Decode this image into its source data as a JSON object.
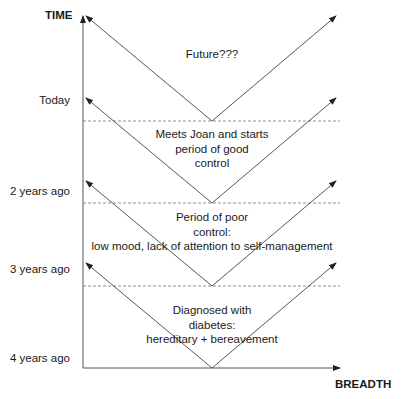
{
  "axes": {
    "y_title": "TIME",
    "x_title": "BREADTH",
    "y_ticks": [
      "Today",
      "2 years ago",
      "3 years ago",
      "4 years ago"
    ]
  },
  "periods": [
    {
      "label": "Future???"
    },
    {
      "label_lines": [
        "Meets Joan and starts",
        "period of good",
        "control"
      ]
    },
    {
      "label_lines": [
        "Period of poor",
        "control:",
        "low mood, lack of attention to self-management"
      ]
    },
    {
      "label_lines": [
        "Diagnosed with",
        "diabetes:",
        "hereditary + bereavement"
      ]
    }
  ],
  "colors": {
    "line": "#333333",
    "dash": "#777777",
    "text": "#1a1a1a"
  }
}
